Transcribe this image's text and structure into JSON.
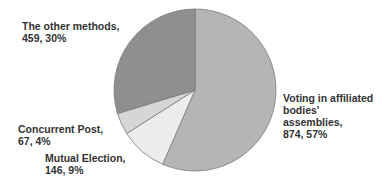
{
  "chart_data": {
    "type": "pie",
    "title": "",
    "start_angle_deg": 0,
    "direction": "clockwise",
    "slices": [
      {
        "name": "Voting in affiliated bodies' assemblies",
        "value": 874,
        "percent": 57,
        "color": "#b5b5b5",
        "label": "Voting in affiliated\nbodies'\nassemblies,\n874, 57%"
      },
      {
        "name": "Mutual Election",
        "value": 146,
        "percent": 9,
        "color": "#ececec",
        "label": "Mutual Election,\n146, 9%"
      },
      {
        "name": "Concurrent Post",
        "value": 67,
        "percent": 4,
        "color": "#d6d6d6",
        "label": "Concurrent Post,\n67, 4%"
      },
      {
        "name": "The other methods",
        "value": 459,
        "percent": 30,
        "color": "#8f8f8f",
        "label": "The other methods,\n459, 30%"
      }
    ],
    "legend": "none (data labels)"
  },
  "labels": {
    "voting": "Voting in affiliated\nbodies'\nassemblies,\n874, 57%",
    "mutual": "Mutual Election,\n146, 9%",
    "concurrent": "Concurrent Post,\n67, 4%",
    "other": "The other methods,\n459, 30%"
  }
}
